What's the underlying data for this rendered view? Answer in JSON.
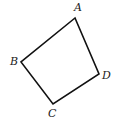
{
  "diagram": {
    "type": "quadrilateral",
    "stroke_color": "#111111",
    "vertices": [
      {
        "label": "A",
        "x": 75,
        "y": 18,
        "lx": 74,
        "ly": 11
      },
      {
        "label": "B",
        "x": 21,
        "y": 62,
        "lx": 10,
        "ly": 65
      },
      {
        "label": "C",
        "x": 53,
        "y": 104,
        "lx": 48,
        "ly": 117
      },
      {
        "label": "D",
        "x": 99,
        "y": 74,
        "lx": 102,
        "ly": 79
      }
    ]
  }
}
